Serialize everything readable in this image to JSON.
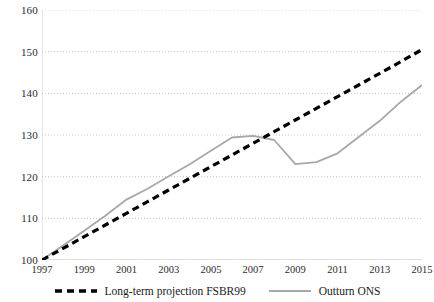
{
  "chart_data": {
    "type": "line",
    "title": "",
    "subtitle": "",
    "xlabel": "",
    "ylabel": "",
    "xlim": [
      1997,
      2015
    ],
    "ylim": [
      100,
      160
    ],
    "yticks": [
      100,
      110,
      120,
      130,
      140,
      150,
      160
    ],
    "xticks": [
      1997,
      1999,
      2001,
      2003,
      2005,
      2007,
      2009,
      2011,
      2013,
      2015
    ],
    "x": [
      1997,
      1998,
      1999,
      2000,
      2001,
      2002,
      2003,
      2004,
      2005,
      2006,
      2007,
      2008,
      2009,
      2010,
      2011,
      2012,
      2013,
      2014,
      2015
    ],
    "grid": "horizontal-dotted",
    "legend_position": "bottom-center",
    "series": [
      {
        "name": "Long-term projection FSBR99",
        "style": "dashed",
        "color": "#000000",
        "width": 3.2,
        "values": [
          100.0,
          102.8,
          105.6,
          108.4,
          111.2,
          114.0,
          116.8,
          119.6,
          122.4,
          125.2,
          128.0,
          130.8,
          133.6,
          136.4,
          139.2,
          142.0,
          144.8,
          147.6,
          150.5
        ]
      },
      {
        "name": "Outturn ONS",
        "style": "solid",
        "color": "#a8a8a8",
        "width": 1.8,
        "values": [
          100.0,
          103.5,
          107.0,
          110.6,
          114.5,
          117.1,
          120.1,
          123.0,
          126.2,
          129.4,
          129.8,
          128.8,
          123.0,
          123.5,
          125.6,
          129.5,
          133.4,
          138.0,
          142.0
        ]
      }
    ]
  },
  "axis": {
    "y_tick_labels": [
      "160",
      "150",
      "140",
      "130",
      "120",
      "110",
      "100"
    ],
    "x_tick_labels": [
      "1997",
      "1999",
      "2001",
      "2003",
      "2005",
      "2007",
      "2009",
      "2011",
      "2013",
      "2015"
    ]
  },
  "legend": {
    "items": [
      {
        "label": "Long-term projection FSBR99",
        "marker": "dashed-line-swatch",
        "color": "#000000"
      },
      {
        "label": "Outturn ONS",
        "marker": "solid-line-swatch",
        "color": "#a8a8a8"
      }
    ]
  },
  "colors": {
    "projection": "#000000",
    "outturn": "#a8a8a8",
    "gridline": "#bdbdbd",
    "axis_line": "#c9c9c9",
    "text": "#1a1a1a",
    "background": "#ffffff"
  }
}
